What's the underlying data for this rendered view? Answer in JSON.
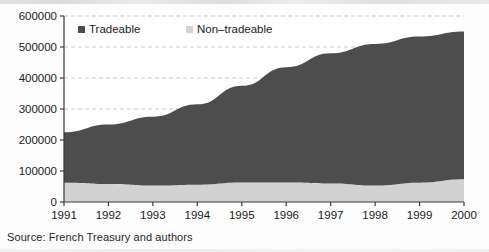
{
  "figure": {
    "source_note": "Source: French Treasury and authors"
  },
  "legend": {
    "position": "top-left-inside",
    "items": [
      {
        "label": "Tradeable",
        "marker": "filled-square",
        "color": "#4d4d4d"
      },
      {
        "label": "Non–tradeable",
        "marker": "filled-square",
        "color": "#d2d2d2"
      }
    ]
  },
  "axes": {
    "y_ticks": [
      "0",
      "100000",
      "200000",
      "300000",
      "400000",
      "500000",
      "600000"
    ],
    "x_ticks": [
      "1991",
      "1992",
      "1993",
      "1994",
      "1995",
      "1996",
      "1997",
      "1998",
      "1999",
      "2000"
    ]
  },
  "colors": {
    "tradeable": "#4d4d4d",
    "non_tradeable": "#d2d2d2",
    "axis": "#3a3a3a",
    "grid": "#c9c9c9",
    "text": "#1a1a1a"
  },
  "chart_data": {
    "type": "area",
    "title": "",
    "subtitle": "",
    "xlabel": "",
    "ylabel": "",
    "stacked": true,
    "grid": true,
    "legend_position": "top-left",
    "x": [
      1991,
      1992,
      1993,
      1994,
      1995,
      1996,
      1997,
      1998,
      1999,
      2000
    ],
    "categories": [
      "1991",
      "1992",
      "1993",
      "1994",
      "1995",
      "1996",
      "1997",
      "1998",
      "1999",
      "2000"
    ],
    "xlim": [
      1991,
      2000
    ],
    "ylim": [
      0,
      600000
    ],
    "ytick_interval": 100000,
    "series": [
      {
        "name": "Non–tradeable",
        "color": "#d2d2d2",
        "values": [
          62000,
          58000,
          53000,
          56000,
          63000,
          63000,
          60000,
          53000,
          62000,
          73000
        ]
      },
      {
        "name": "Tradeable",
        "color": "#4d4d4d",
        "values": [
          163000,
          192000,
          222000,
          259000,
          312000,
          372000,
          420000,
          457000,
          472000,
          477000
        ]
      }
    ],
    "totals": [
      225000,
      250000,
      275000,
      315000,
      375000,
      435000,
      480000,
      510000,
      534000,
      550000
    ],
    "stacked_totals": [
      225000,
      250000,
      275000,
      315000,
      375000,
      435000,
      480000,
      510000,
      534000,
      550000
    ]
  }
}
